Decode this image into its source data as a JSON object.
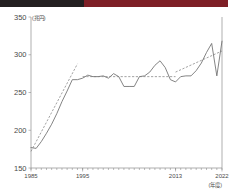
{
  "banner": {
    "dark_color": "#231f20",
    "red_color": "#7e1f26"
  },
  "chart_data": {
    "type": "line",
    "title": "",
    "subtitle": "",
    "xlabel": "(年度)",
    "ylabel": "(兆円)",
    "ylim": [
      150,
      350
    ],
    "xlim": [
      1985,
      2022
    ],
    "grid": false,
    "legend_position": "none",
    "y_ticks": [
      150,
      200,
      250,
      300,
      350
    ],
    "y_tick_labels": [
      "150",
      "200",
      "250",
      "300",
      "350"
    ],
    "x_ticks": [
      1985,
      1995,
      2013,
      2022
    ],
    "x_tick_labels": [
      "1985",
      "1995",
      "2013",
      "2022"
    ],
    "x_minor_tick_interval": 1,
    "series": [
      {
        "name": "国民医療費",
        "style": "solid",
        "color": "#6e6e6e",
        "x": [
          1985,
          1986,
          1987,
          1988,
          1989,
          1990,
          1991,
          1992,
          1993,
          1994,
          1995,
          1996,
          1997,
          1998,
          1999,
          2000,
          2001,
          2002,
          2003,
          2004,
          2005,
          2006,
          2007,
          2008,
          2009,
          2010,
          2011,
          2012,
          2013,
          2014,
          2015,
          2016,
          2017,
          2018,
          2019,
          2020,
          2021,
          2022
        ],
        "values": [
          177,
          176,
          185,
          196,
          208,
          222,
          238,
          252,
          267,
          267,
          269,
          273,
          271,
          271,
          272,
          269,
          275,
          271,
          258,
          258,
          258,
          271,
          272,
          277,
          286,
          292,
          283,
          267,
          264,
          271,
          272,
          272,
          279,
          289,
          303,
          315,
          272,
          318
        ]
      },
      {
        "name": "トレンド線1",
        "style": "dashed",
        "color": "#7a7a7a",
        "x": [
          1985,
          1994
        ],
        "values": [
          172,
          288
        ]
      },
      {
        "name": "トレンド線2",
        "style": "dashed",
        "color": "#7a7a7a",
        "x": [
          1995,
          2013
        ],
        "values": [
          271,
          271
        ]
      },
      {
        "name": "トレンド線3",
        "style": "dashed",
        "color": "#7a7a7a",
        "x": [
          2013,
          2022
        ],
        "values": [
          277,
          305
        ]
      }
    ]
  }
}
